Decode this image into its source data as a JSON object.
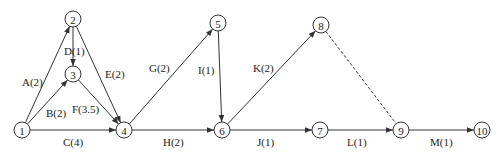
{
  "diagram": {
    "type": "activity-on-arrow network",
    "nodes": [
      {
        "id": "1",
        "label": "1",
        "x": 22,
        "y": 130
      },
      {
        "id": "2",
        "label": "2",
        "x": 73,
        "y": 19
      },
      {
        "id": "3",
        "label": "3",
        "x": 73,
        "y": 74
      },
      {
        "id": "4",
        "label": "4",
        "x": 124,
        "y": 130
      },
      {
        "id": "5",
        "label": "5",
        "x": 218,
        "y": 23
      },
      {
        "id": "6",
        "label": "6",
        "x": 222,
        "y": 130
      },
      {
        "id": "7",
        "label": "7",
        "x": 320,
        "y": 130
      },
      {
        "id": "8",
        "label": "8",
        "x": 321,
        "y": 25
      },
      {
        "id": "9",
        "label": "9",
        "x": 401,
        "y": 130
      },
      {
        "id": "10",
        "label": "10",
        "x": 482,
        "y": 130
      }
    ],
    "edges": [
      {
        "from": "1",
        "to": "2",
        "label": "A(2)",
        "dummy": false,
        "lx": 22,
        "ly": 86
      },
      {
        "from": "1",
        "to": "3",
        "label": "B(2)",
        "dummy": false,
        "lx": 46,
        "ly": 117
      },
      {
        "from": "1",
        "to": "4",
        "label": "C(4)",
        "dummy": false,
        "lx": 63,
        "ly": 146
      },
      {
        "from": "2",
        "to": "3",
        "label": "D(1)",
        "dummy": false,
        "lx": 64,
        "ly": 55
      },
      {
        "from": "2",
        "to": "4",
        "label": "E(2)",
        "dummy": false,
        "lx": 105,
        "ly": 78
      },
      {
        "from": "3",
        "to": "4",
        "label": "F(3.5)",
        "dummy": false,
        "lx": 72,
        "ly": 113
      },
      {
        "from": "4",
        "to": "5",
        "label": "G(2)",
        "dummy": false,
        "lx": 149,
        "ly": 72
      },
      {
        "from": "5",
        "to": "6",
        "label": "I(1)",
        "dummy": false,
        "lx": 198,
        "ly": 74
      },
      {
        "from": "4",
        "to": "6",
        "label": "H(2)",
        "dummy": false,
        "lx": 163,
        "ly": 146
      },
      {
        "from": "6",
        "to": "8",
        "label": "K(2)",
        "dummy": false,
        "lx": 253,
        "ly": 72
      },
      {
        "from": "6",
        "to": "7",
        "label": "J(1)",
        "dummy": false,
        "lx": 257,
        "ly": 146
      },
      {
        "from": "8",
        "to": "9",
        "label": "",
        "dummy": true,
        "lx": 0,
        "ly": 0
      },
      {
        "from": "7",
        "to": "9",
        "label": "L(1)",
        "dummy": false,
        "lx": 347,
        "ly": 146
      },
      {
        "from": "9",
        "to": "10",
        "label": "M(1)",
        "dummy": false,
        "lx": 430,
        "ly": 146
      }
    ],
    "style": {
      "line_color": "#333333",
      "text_color": "#222222",
      "background": "#ffffff",
      "node_radius": 8
    }
  }
}
